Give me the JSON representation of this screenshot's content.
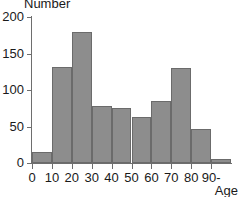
{
  "chart_data": {
    "type": "bar",
    "title": "",
    "ylabel": "Number",
    "xlabel": "Age",
    "categories": [
      "0",
      "10",
      "20",
      "30",
      "40",
      "50",
      "60",
      "70",
      "80",
      "90-"
    ],
    "bin_labels": [
      "0-10",
      "10-20",
      "20-30",
      "30-40",
      "40-50",
      "50-60",
      "60-70",
      "70-80",
      "80-90",
      "90-"
    ],
    "values": [
      15,
      132,
      180,
      78,
      75,
      63,
      85,
      130,
      46,
      5
    ],
    "ylim": [
      0,
      200
    ],
    "yticks": [
      0,
      50,
      100,
      150,
      200
    ],
    "xlim": [
      0,
      100
    ],
    "xticks": [
      0,
      10,
      20,
      30,
      40,
      50,
      60,
      70,
      80,
      90
    ],
    "xtick_labels": [
      "0",
      "10",
      "20",
      "30",
      "40",
      "50",
      "60",
      "70",
      "80",
      "90-"
    ],
    "grid": false,
    "legend": null,
    "bar_color": "#8d8d8d",
    "bar_edge_color": "#6b6b6b",
    "axis_color": "#6e6e6e",
    "text_color": "#1a1a1a",
    "background": "#ffffff"
  }
}
